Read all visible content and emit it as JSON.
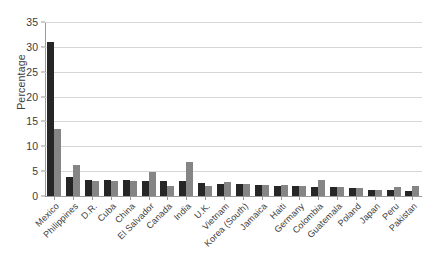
{
  "chart_data": {
    "type": "bar",
    "title": "",
    "xlabel": "",
    "ylabel": "Percentage",
    "ylim": [
      0,
      35
    ],
    "yticks": [
      0,
      5,
      10,
      15,
      20,
      25,
      30,
      35
    ],
    "grid": true,
    "legend": "none",
    "bar_colors": [
      "#262626",
      "#858585"
    ],
    "categories": [
      "Mexico",
      "Philippines",
      "D.R.",
      "Cuba",
      "China",
      "El Salvador",
      "Canada",
      "India",
      "U.K.",
      "Vietnam",
      "Korea (South)",
      "Jamaica",
      "Haiti",
      "Germany",
      "Colombia",
      "Guatemala",
      "Poland",
      "Japan",
      "Peru",
      "Pakistan"
    ],
    "series": [
      {
        "name": "Series 1",
        "color": "#262626",
        "values": [
          31.0,
          3.9,
          3.3,
          3.2,
          3.2,
          3.1,
          3.0,
          3.0,
          2.6,
          2.5,
          2.4,
          2.2,
          2.1,
          2.0,
          1.9,
          1.8,
          1.7,
          1.3,
          1.2,
          1.1
        ]
      },
      {
        "name": "Series 2",
        "color": "#858585",
        "values": [
          13.5,
          6.2,
          3.0,
          3.0,
          3.0,
          4.8,
          2.1,
          6.9,
          2.0,
          2.8,
          2.5,
          2.2,
          2.2,
          2.0,
          3.2,
          1.8,
          1.7,
          1.3,
          1.8,
          2.1
        ]
      }
    ]
  }
}
